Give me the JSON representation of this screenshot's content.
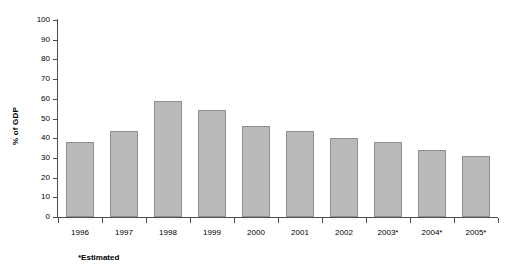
{
  "chart_data": {
    "type": "bar",
    "title": "",
    "subtitle": "",
    "xlabel": "",
    "ylabel": "% of GDP",
    "ylim": [
      0,
      100
    ],
    "ytick_step": 10,
    "yticks": [
      "100",
      "90",
      "80",
      "70",
      "60",
      "50",
      "40",
      "30",
      "20",
      "10",
      "0"
    ],
    "grid": false,
    "legend": null,
    "categories": [
      "1996",
      "1997",
      "1998",
      "1999",
      "2000",
      "2001",
      "2002",
      "2003*",
      "2004*",
      "2005*"
    ],
    "values": [
      38,
      43.5,
      59,
      54.5,
      46,
      43.5,
      40,
      38,
      34,
      31
    ],
    "annotations": [
      "*Estimated"
    ],
    "bar_fill_color": "#b9b9b9",
    "bar_border_color": "#8f8f8f",
    "axis_color": "#4d4d4d",
    "text_color": "#000000",
    "background_color": "#ffffff"
  },
  "footnote": "*Estimated"
}
